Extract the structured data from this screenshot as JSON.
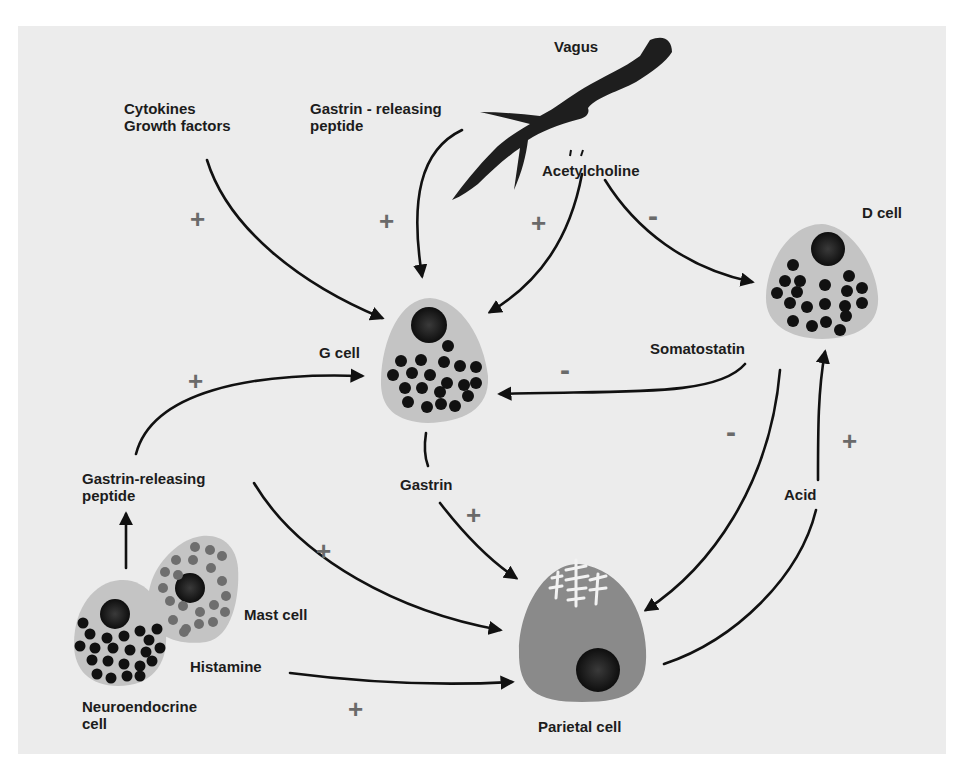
{
  "colors": {
    "background": "#ffffff",
    "panel": "#ececec",
    "cell_body": "#c4c4c4",
    "parietal_body": "#8a8a8a",
    "nucleus": "#151515",
    "granule_dark": "#111111",
    "granule_gray": "#6e6e6e",
    "arrow": "#111111",
    "sign": "#6a6a6a"
  },
  "labels": {
    "vagus": "Vagus",
    "cytokines_line1": "Cytokines",
    "cytokines_line2": "Growth factors",
    "grp_top_line1": "Gastrin - releasing",
    "grp_top_line2": "peptide",
    "acetylcholine": "Acetylcholine",
    "d_cell": "D cell",
    "g_cell": "G cell",
    "somatostatin": "Somatostatin",
    "gastrin": "Gastrin",
    "acid": "Acid",
    "grp_left_line1": "Gastrin-releasing",
    "grp_left_line2": "peptide",
    "mast_cell": "Mast cell",
    "histamine": "Histamine",
    "neuroendocrine_line1": "Neuroendocrine",
    "neuroendocrine_line2": "cell",
    "parietal_cell": "Parietal cell"
  },
  "signs": {
    "cytokines_to_g": "+",
    "grp_to_g": "+",
    "ach_to_g": "+",
    "ach_to_d": "-",
    "grp_left_to_g": "+",
    "somatostatin_to_g": "-",
    "somatostatin_to_parietal": "-",
    "acid_to_d": "+",
    "gastrin_to_parietal": "+",
    "grp_left_to_parietal": "+",
    "histamine_to_parietal": "+"
  },
  "relations": [
    {
      "from": "Cytokines / Growth factors",
      "to": "G cell",
      "effect": "+"
    },
    {
      "from": "Gastrin-releasing peptide",
      "to": "G cell",
      "effect": "+"
    },
    {
      "from": "Acetylcholine (Vagus)",
      "to": "G cell",
      "effect": "+"
    },
    {
      "from": "Acetylcholine (Vagus)",
      "to": "D cell",
      "effect": "-"
    },
    {
      "from": "Somatostatin (D cell)",
      "to": "G cell",
      "effect": "-"
    },
    {
      "from": "Somatostatin (D cell)",
      "to": "Parietal cell",
      "effect": "-"
    },
    {
      "from": "Gastrin (G cell)",
      "to": "Parietal cell",
      "effect": "+"
    },
    {
      "from": "Acid (Parietal cell)",
      "to": "D cell",
      "effect": "+"
    },
    {
      "from": "Neuroendocrine cell",
      "to": "Gastrin-releasing peptide",
      "effect": ""
    },
    {
      "from": "Gastrin-releasing peptide (neuroendocrine)",
      "to": "G cell",
      "effect": "+"
    },
    {
      "from": "Gastrin-releasing peptide (neuroendocrine)",
      "to": "Parietal cell",
      "effect": "+"
    },
    {
      "from": "Histamine (Mast cell)",
      "to": "Parietal cell",
      "effect": "+"
    }
  ]
}
